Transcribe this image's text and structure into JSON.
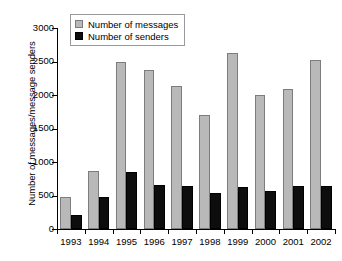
{
  "chart_data": {
    "type": "bar",
    "title": "",
    "xlabel": "",
    "ylabel": "Number of messages/message senders",
    "ylim": [
      0,
      3000
    ],
    "yticks": [
      0,
      500,
      1000,
      1500,
      2000,
      2500,
      3000
    ],
    "ytick_labels": [
      "0",
      "500",
      "1000",
      "1500",
      "2000",
      "2500",
      "3000"
    ],
    "grid": false,
    "legend_position": "top-left",
    "categories": [
      "1993",
      "1994",
      "1995",
      "1996",
      "1997",
      "1998",
      "1999",
      "2000",
      "2001",
      "2002"
    ],
    "series": [
      {
        "name": "Number of messages",
        "color": "#b9b9b9",
        "values": [
          480,
          870,
          2490,
          2380,
          2140,
          1700,
          2630,
          2000,
          2090,
          2530
        ]
      },
      {
        "name": "Number of senders",
        "color": "#0d0d0d",
        "values": [
          210,
          480,
          855,
          660,
          645,
          535,
          630,
          565,
          635,
          640
        ]
      }
    ]
  },
  "legend": {
    "items": [
      {
        "label": "Number of messages",
        "swatch": "messages-swatch"
      },
      {
        "label": "Number of senders",
        "swatch": "senders-swatch"
      }
    ]
  }
}
